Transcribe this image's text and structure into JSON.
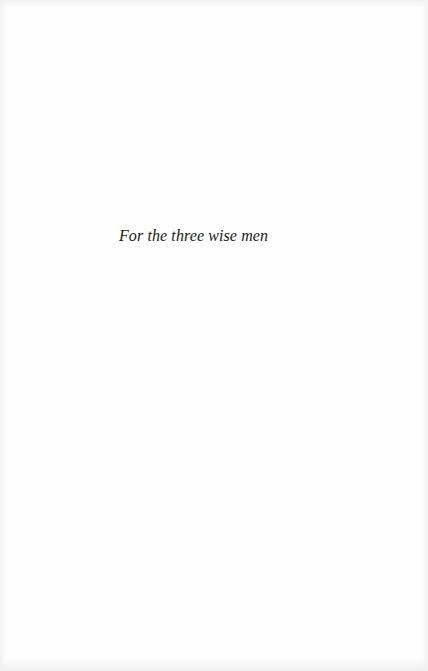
{
  "page": {
    "type": "dedication",
    "dedication_text": "For the three wise men"
  },
  "colors": {
    "paper": "#fefefe",
    "ink": "#1a1a1a"
  }
}
